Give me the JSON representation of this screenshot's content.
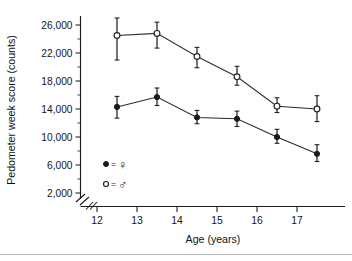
{
  "chart_data": {
    "type": "line",
    "title": "",
    "subtitle": "",
    "xlabel": "Age (years)",
    "ylabel": "Pedometer week score (counts)",
    "x": [
      12.5,
      13.5,
      14.5,
      15.5,
      16.5,
      17.5
    ],
    "xlim": [
      11.8,
      18.1
    ],
    "ylim": [
      1200,
      27600
    ],
    "xticks": [
      12,
      13,
      14,
      15,
      16,
      17
    ],
    "xtick_labels": [
      "12",
      "13",
      "14",
      "15",
      "16",
      "17"
    ],
    "yticks": [
      2000,
      6000,
      10000,
      14000,
      18000,
      22000,
      26000
    ],
    "ytick_labels": [
      "2,000",
      "6,000",
      "10,000",
      "14,000",
      "18,000",
      "22,000",
      "26,000"
    ],
    "grid": false,
    "axis_break": true,
    "legend_position": "lower-left-inside",
    "series": [
      {
        "name": "Male",
        "symbol": "open-circle",
        "legend_glyph": "♂",
        "values": [
          24500,
          24800,
          21500,
          18600,
          14400,
          14000
        ],
        "err_low": [
          21000,
          22700,
          19900,
          17400,
          13500,
          12200
        ],
        "err_high": [
          27000,
          26400,
          22800,
          20100,
          15600,
          15900
        ]
      },
      {
        "name": "Female",
        "symbol": "filled-circle",
        "legend_glyph": "♀",
        "values": [
          14300,
          15700,
          12800,
          12600,
          10000,
          7600
        ],
        "err_low": [
          12700,
          14500,
          11900,
          11500,
          9100,
          6500
        ],
        "err_high": [
          15800,
          17000,
          13800,
          13700,
          11100,
          8900
        ]
      }
    ]
  },
  "axes": {
    "y_title": "Pedometer week score (counts)",
    "x_title": "Age (years)"
  },
  "legend": {
    "items": [
      {
        "marker": "filled-circle",
        "equals": "=",
        "glyph": "♀",
        "name": "Female"
      },
      {
        "marker": "open-circle",
        "equals": "=",
        "glyph": "♂",
        "name": "Male"
      }
    ]
  }
}
